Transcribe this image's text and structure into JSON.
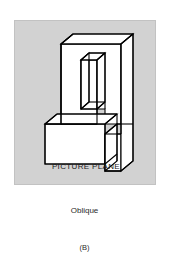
{
  "panel": {
    "label": "PICTURE PLANE",
    "background_color": "#d2d2d2",
    "border_color": "#c2c2c2"
  },
  "captions": {
    "projection": "Oblique",
    "figure": "(B)"
  },
  "drawing": {
    "type": "oblique-projection-pictorial",
    "subject": "notched-block-with-vertical-slot",
    "line_color": "#000000",
    "face_color": "#ffffff",
    "depth_direction": "up-right-45-degrees"
  }
}
